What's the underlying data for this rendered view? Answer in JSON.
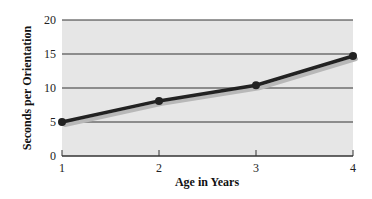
{
  "chart_data": {
    "type": "line",
    "title": "",
    "xlabel": "Age in Years",
    "ylabel": "Seconds per Orientation",
    "x": [
      1,
      2,
      3,
      4
    ],
    "categories": [
      "1",
      "2",
      "3",
      "4"
    ],
    "series": [
      {
        "name": "Seconds per Orientation",
        "values": [
          5,
          8.1,
          10.4,
          14.7
        ]
      }
    ],
    "ylim": [
      0,
      20
    ],
    "yticks": [
      0,
      5,
      10,
      15,
      20
    ],
    "xticks": [
      1,
      2,
      3,
      4
    ],
    "grid": "horizontal",
    "legend": "none"
  },
  "style": {
    "plot_bg": "#e6e6e6",
    "grid_color": "#333333",
    "line_color": "#222222",
    "shadow_color": "#b8b8b8"
  }
}
